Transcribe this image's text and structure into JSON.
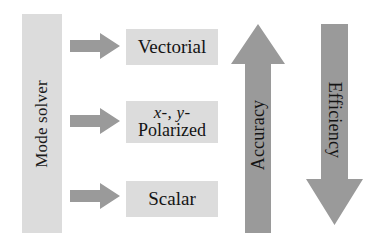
{
  "diagram": {
    "source_node": {
      "label": "Mode solver",
      "orientation": "vertical-bottom-to-top"
    },
    "branches": [
      {
        "arrow_name": "flow-arrow-vectorial",
        "direction": "right",
        "target_label_lines": [
          "Vectorial"
        ],
        "target_name": "vectorial"
      },
      {
        "arrow_name": "flow-arrow-polarized",
        "direction": "right",
        "target_label_lines": [
          "x-, y-",
          "Polarized"
        ],
        "target_name": "polarized"
      },
      {
        "arrow_name": "flow-arrow-scalar",
        "direction": "right",
        "target_label_lines": [
          "Scalar"
        ],
        "target_name": "scalar"
      }
    ],
    "gradient_arrows": [
      {
        "name": "accuracy",
        "label": "Accuracy",
        "direction": "up",
        "text_orientation": "bottom-to-top"
      },
      {
        "name": "efficiency",
        "label": "Efficiency",
        "direction": "down",
        "text_orientation": "top-to-bottom"
      }
    ],
    "colors": {
      "background": "#ffffff",
      "box_fill": "#dcdcdc",
      "arrow_fill": "#9a9a9a",
      "text": "#141414"
    }
  }
}
